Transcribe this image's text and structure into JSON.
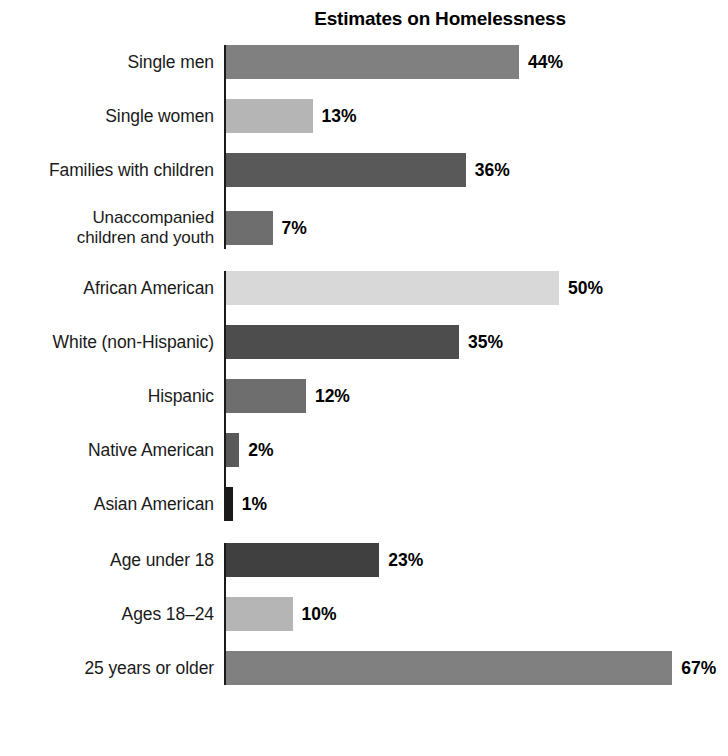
{
  "chart_data": {
    "type": "bar",
    "orientation": "horizontal",
    "title": "Estimates on Homelessness",
    "xlabel": "",
    "ylabel": "",
    "xlim": [
      0,
      70
    ],
    "grid": false,
    "legend": "none",
    "value_suffix": "%",
    "groups": [
      {
        "name": "household-composition",
        "items": [
          {
            "label": "Single men",
            "label_line2": "",
            "value": 44,
            "value_label": "44%",
            "color": "#808080"
          },
          {
            "label": "Single women",
            "label_line2": "",
            "value": 13,
            "value_label": "13%",
            "color": "#b5b5b5"
          },
          {
            "label": "Families with children",
            "label_line2": "",
            "value": 36,
            "value_label": "36%",
            "color": "#595959"
          },
          {
            "label": "Unaccompanied",
            "label_line2": "children and youth",
            "value": 7,
            "value_label": "7%",
            "color": "#6e6e6e"
          }
        ]
      },
      {
        "name": "race-ethnicity",
        "items": [
          {
            "label": "African American",
            "label_line2": "",
            "value": 50,
            "value_label": "50%",
            "color": "#d8d8d8"
          },
          {
            "label": "White (non-Hispanic)",
            "label_line2": "",
            "value": 35,
            "value_label": "35%",
            "color": "#4d4d4d"
          },
          {
            "label": "Hispanic",
            "label_line2": "",
            "value": 12,
            "value_label": "12%",
            "color": "#6e6e6e"
          },
          {
            "label": "Native American",
            "label_line2": "",
            "value": 2,
            "value_label": "2%",
            "color": "#595959"
          },
          {
            "label": "Asian American",
            "label_line2": "",
            "value": 1,
            "value_label": "1%",
            "color": "#1a1a1a"
          }
        ]
      },
      {
        "name": "age",
        "items": [
          {
            "label": "Age under 18",
            "label_line2": "",
            "value": 23,
            "value_label": "23%",
            "color": "#404040"
          },
          {
            "label": "Ages 18–24",
            "label_line2": "",
            "value": 10,
            "value_label": "10%",
            "color": "#b5b5b5"
          },
          {
            "label": "25 years or older",
            "label_line2": "",
            "value": 67,
            "value_label": "67%",
            "color": "#808080"
          }
        ]
      }
    ],
    "categories": [
      "Single men",
      "Single women",
      "Families with children",
      "Unaccompanied children and youth",
      "African American",
      "White (non-Hispanic)",
      "Hispanic",
      "Native American",
      "Asian American",
      "Age under 18",
      "Ages 18–24",
      "25 years or older"
    ],
    "values": [
      44,
      13,
      36,
      7,
      50,
      35,
      12,
      2,
      1,
      23,
      10,
      67
    ]
  },
  "render": {
    "px_per_unit": 6.66,
    "axis_color": "#1a1a1a"
  }
}
